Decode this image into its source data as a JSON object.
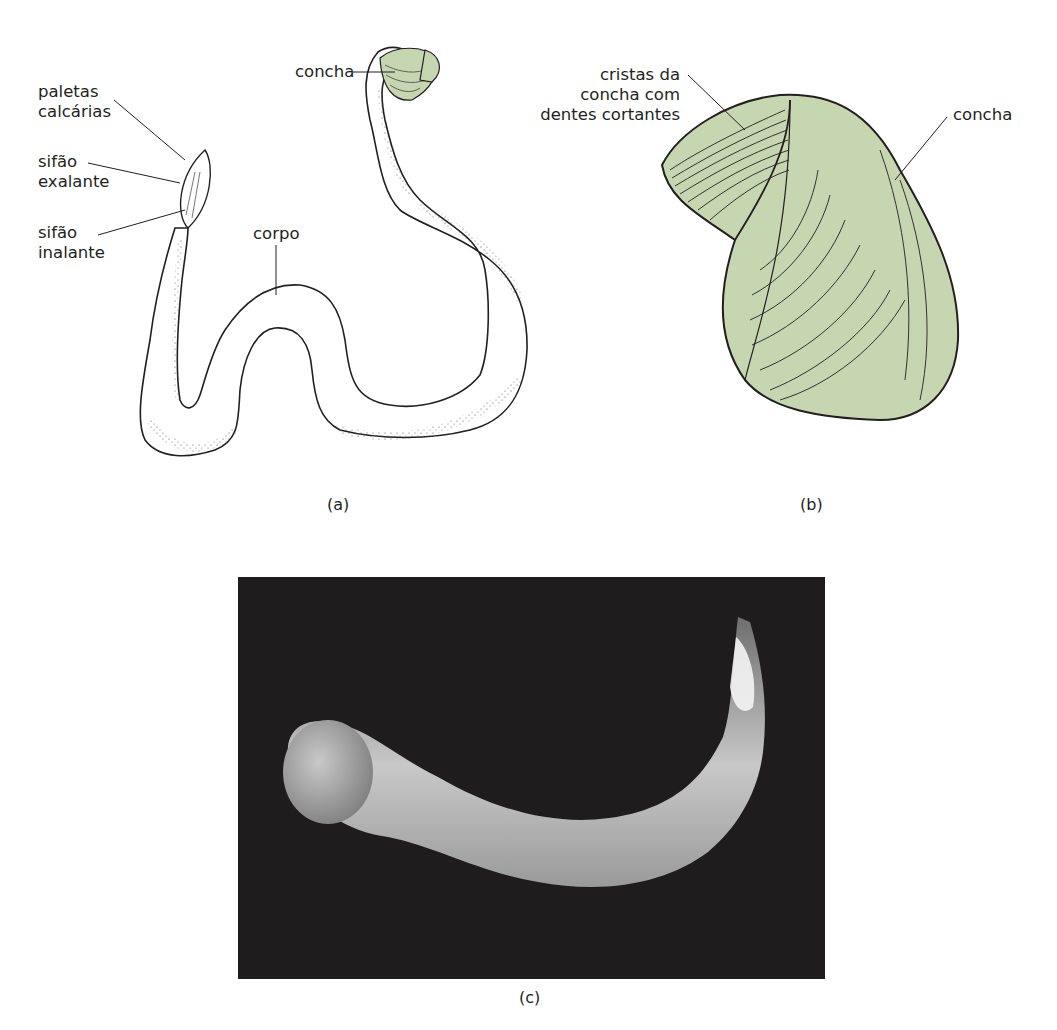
{
  "figure": {
    "panels": [
      {
        "id": "a",
        "caption": "(a)",
        "type": "line-drawing",
        "labels": {
          "paletas": [
            "paletas",
            "calcárias"
          ],
          "sifao_exalante": [
            "sifão",
            "exalante"
          ],
          "sifao_inalante": [
            "sifão",
            "inalante"
          ],
          "corpo": "corpo",
          "concha": "concha"
        }
      },
      {
        "id": "b",
        "caption": "(b)",
        "type": "line-drawing",
        "labels": {
          "cristas": [
            "cristas da",
            "concha com",
            "dentes cortantes"
          ],
          "concha": "concha"
        }
      },
      {
        "id": "c",
        "caption": "(c)",
        "type": "photograph"
      }
    ],
    "colors": {
      "shell_fill": "#c5d6b0",
      "ink": "#231f20",
      "photo_bg": "#1f1c1d",
      "body_light": "#d8d8d8"
    }
  }
}
